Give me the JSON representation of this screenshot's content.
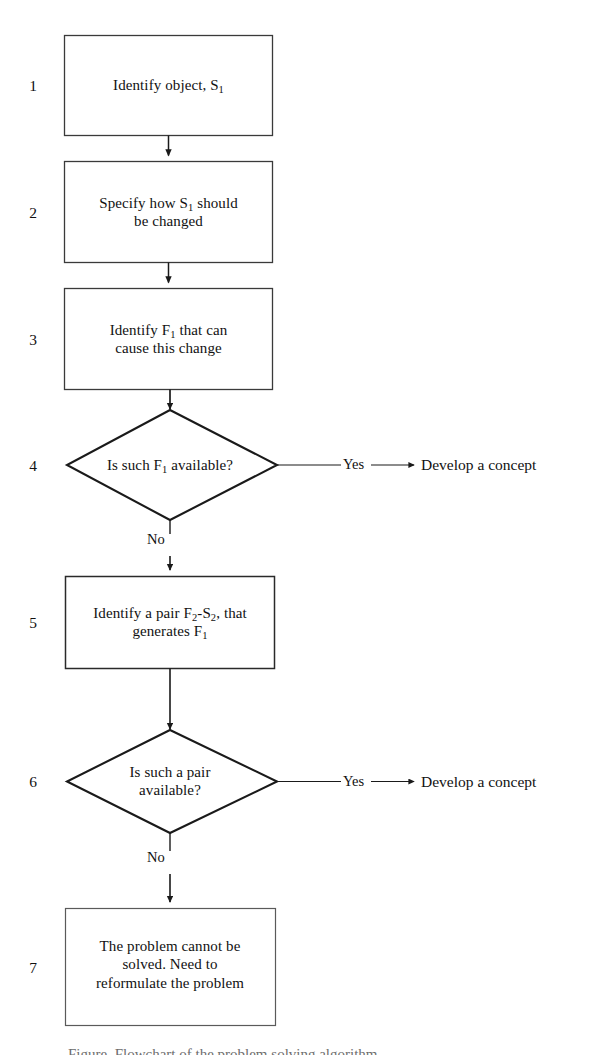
{
  "diagram": {
    "type": "flowchart",
    "background_color": "#ffffff",
    "stroke_color": "#1a1a1a",
    "nodes": [
      {
        "number": "1",
        "shape": "rectangle",
        "lines": [
          {
            "parts": [
              {
                "t": "Identify object, S"
              },
              {
                "sub": "1"
              }
            ]
          }
        ]
      },
      {
        "number": "2",
        "shape": "rectangle",
        "lines": [
          {
            "parts": [
              {
                "t": "Specify how S"
              },
              {
                "sub": "1"
              },
              {
                "t": " should"
              }
            ]
          },
          {
            "parts": [
              {
                "t": "be changed"
              }
            ]
          }
        ]
      },
      {
        "number": "3",
        "shape": "rectangle",
        "lines": [
          {
            "parts": [
              {
                "t": "Identify  F"
              },
              {
                "sub": "1"
              },
              {
                "t": " that can"
              }
            ]
          },
          {
            "parts": [
              {
                "t": "cause this change"
              }
            ]
          }
        ]
      },
      {
        "number": "4",
        "shape": "diamond",
        "lines": [
          {
            "parts": [
              {
                "t": "Is such F"
              },
              {
                "sub": "1"
              },
              {
                "t": " available?"
              }
            ]
          }
        ]
      },
      {
        "number": "5",
        "shape": "rectangle",
        "lines": [
          {
            "parts": [
              {
                "t": "Identify a pair F"
              },
              {
                "sub": "2"
              },
              {
                "t": "-S"
              },
              {
                "sub": "2"
              },
              {
                "t": ", that"
              }
            ]
          },
          {
            "parts": [
              {
                "t": "generates F"
              },
              {
                "sub": "1"
              }
            ]
          }
        ]
      },
      {
        "number": "6",
        "shape": "diamond",
        "lines": [
          {
            "parts": [
              {
                "t": "Is such a pair"
              }
            ]
          },
          {
            "parts": [
              {
                "t": "available?"
              }
            ]
          }
        ]
      },
      {
        "number": "7",
        "shape": "rectangle",
        "lines": [
          {
            "parts": [
              {
                "t": "The problem cannot be"
              }
            ]
          },
          {
            "parts": [
              {
                "t": "solved. Need to"
              }
            ]
          },
          {
            "parts": [
              {
                "t": "reformulate the problem"
              }
            ]
          }
        ]
      }
    ],
    "edge_labels": {
      "yes_from_4": "Yes",
      "no_from_4": "No",
      "yes_from_6": "Yes",
      "no_from_6": "No"
    },
    "terminals": {
      "from_4": "Develop a concept",
      "from_6": "Develop a concept"
    },
    "caption_sliver": "Figure. Flowchart of the problem solving algorithm"
  }
}
